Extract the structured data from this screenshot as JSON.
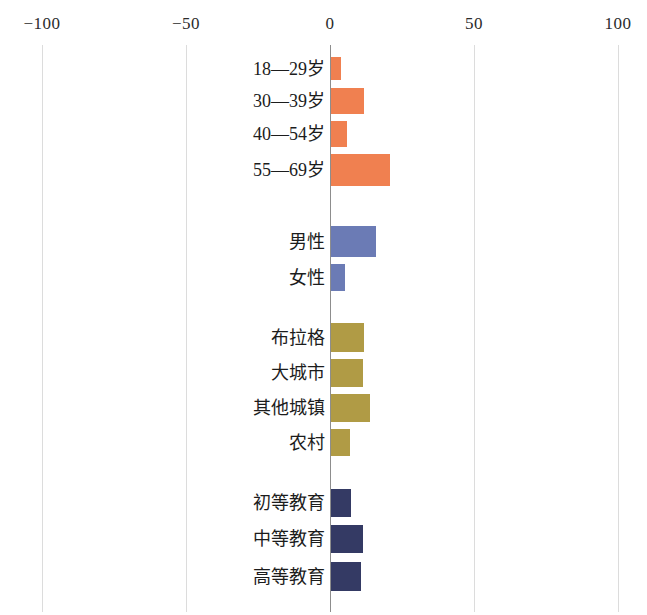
{
  "chart_data": {
    "type": "bar",
    "orientation": "horizontal",
    "title": "",
    "subtitle": "",
    "xlabel": "",
    "ylabel": "",
    "xlim": [
      -100,
      100
    ],
    "xticks": [
      -100,
      -50,
      0,
      50,
      100
    ],
    "xticklabels": [
      "−100",
      "−50",
      "0",
      "50",
      "100"
    ],
    "grid": true,
    "legend": "none",
    "zero_line": true,
    "groups": [
      {
        "name": "age",
        "color": "#f08050",
        "categories": [
          "18—29岁",
          "30—39岁",
          "40—54岁",
          "55—69岁"
        ],
        "values": [
          3.5,
          11.5,
          5.5,
          20.5
        ]
      },
      {
        "name": "gender",
        "color": "#6b7bb5",
        "categories": [
          "男性",
          "女性"
        ],
        "values": [
          15.5,
          5
        ]
      },
      {
        "name": "settlement",
        "color": "#b09b45",
        "categories": [
          "布拉格",
          "大城市",
          "其他城镇",
          "农村"
        ],
        "values": [
          11.5,
          11,
          13.5,
          6.5
        ]
      },
      {
        "name": "education",
        "color": "#343a64",
        "categories": [
          "初等教育",
          "中等教育",
          "高等教育"
        ],
        "values": [
          7,
          11,
          10.5
        ]
      }
    ]
  },
  "axis": {
    "ticks": [
      {
        "label": "−100",
        "value": -100,
        "x": 42
      },
      {
        "label": "−50",
        "value": -50,
        "x": 186
      },
      {
        "label": "0",
        "value": 0,
        "x": 330
      },
      {
        "label": "50",
        "value": 50,
        "x": 474
      },
      {
        "label": "100",
        "value": 100,
        "x": 618
      }
    ]
  },
  "bars": [
    {
      "label": "18—29岁",
      "value": 3.5,
      "color": "#f08050",
      "top": 57,
      "height": 23,
      "group": "age"
    },
    {
      "label": "30—39岁",
      "value": 11.5,
      "color": "#f08050",
      "top": 88,
      "height": 26,
      "group": "age"
    },
    {
      "label": "40—54岁",
      "value": 5.5,
      "color": "#f08050",
      "top": 121,
      "height": 26,
      "group": "age"
    },
    {
      "label": "55—69岁",
      "value": 20.5,
      "color": "#f08050",
      "top": 154,
      "height": 32,
      "group": "age"
    },
    {
      "label": "男性",
      "value": 15.5,
      "color": "#6b7bb5",
      "top": 226,
      "height": 31,
      "group": "gender"
    },
    {
      "label": "女性",
      "value": 5,
      "color": "#6b7bb5",
      "top": 264,
      "height": 27,
      "group": "gender"
    },
    {
      "label": "布拉格",
      "value": 11.5,
      "color": "#b09b45",
      "top": 323,
      "height": 29,
      "group": "settlement"
    },
    {
      "label": "大城市",
      "value": 11,
      "color": "#b09b45",
      "top": 359,
      "height": 28,
      "group": "settlement"
    },
    {
      "label": "其他城镇",
      "value": 13.5,
      "color": "#b09b45",
      "top": 394,
      "height": 28,
      "group": "settlement"
    },
    {
      "label": "农村",
      "value": 6.5,
      "color": "#b09b45",
      "top": 429,
      "height": 27,
      "group": "settlement"
    },
    {
      "label": "初等教育",
      "value": 7,
      "color": "#343a64",
      "top": 489,
      "height": 28,
      "group": "education"
    },
    {
      "label": "中等教育",
      "value": 11,
      "color": "#343a64",
      "top": 525,
      "height": 28,
      "group": "education"
    },
    {
      "label": "高等教育",
      "value": 10.5,
      "color": "#343a64",
      "top": 562,
      "height": 29,
      "group": "education"
    }
  ]
}
